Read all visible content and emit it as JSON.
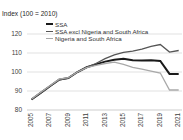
{
  "title": "Index (100 = 2010)",
  "chart_data": {
    "type": "line",
    "title": "Index (100 = 2010)",
    "x": [
      2005,
      2006,
      2007,
      2008,
      2009,
      2010,
      2011,
      2012,
      2013,
      2014,
      2015,
      2016,
      2017,
      2018,
      2019,
      2020,
      2021
    ],
    "x_tick_labels": [
      "2005",
      "2007",
      "2009",
      "2011",
      "2013",
      "2015",
      "2017",
      "2019",
      "2021"
    ],
    "y_ticks": [
      80,
      90,
      100,
      110,
      120
    ],
    "ylim": [
      80,
      120
    ],
    "grid": true,
    "legend_position": "top-left",
    "gridline_color": "#d9d9d9",
    "axis_line_color": "#c0c0c0",
    "series": [
      {
        "name": "SSA",
        "color": "#1a1a1a",
        "line_width": 2,
        "values": [
          85.5,
          89,
          92.5,
          96,
          96.8,
          100,
          102.5,
          104,
          105.5,
          106.5,
          107,
          106.2,
          106,
          106.2,
          105.8,
          99,
          99
        ]
      },
      {
        "name": "SSA excl Nigeria and South Africa",
        "color": "#555555",
        "line_width": 1.3,
        "values": [
          85.5,
          89,
          92.5,
          95.8,
          96.8,
          100,
          102.5,
          104.5,
          107,
          109,
          110.3,
          111,
          112,
          113.5,
          114.5,
          110.5,
          111.3
        ]
      },
      {
        "name": "Nigeria and South Africa",
        "color": "#a9a9a9",
        "line_width": 1.3,
        "values": [
          85.8,
          89.3,
          92.8,
          96.2,
          97,
          100,
          102.3,
          103.5,
          104.5,
          105.2,
          104,
          102.5,
          101.5,
          100.5,
          99.5,
          90.5,
          90.5
        ]
      }
    ]
  }
}
